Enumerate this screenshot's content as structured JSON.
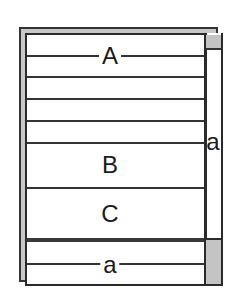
{
  "diagram": {
    "title": "",
    "regions": {
      "header_label": "A",
      "row_b_label": "B",
      "row_c_label": "C",
      "vertical_scrollbar_label": "a",
      "horizontal_scrollbar_label": "a"
    },
    "colors": {
      "line": "#2a2a2a",
      "panel_fill": "#ffffff",
      "shadow_fill": "#c8c8c8",
      "thumb_fill": "#c4c4c4"
    }
  }
}
